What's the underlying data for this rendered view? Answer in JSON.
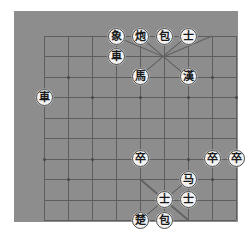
{
  "app": {
    "title": "Xiangqi Board",
    "board_color": "#8d8d8d",
    "line_color": "#5e5e5e",
    "piece_face_color": "#f2f2f2",
    "piece_text_color": "#1a1a1a",
    "page_background": "#ffffff"
  },
  "board": {
    "files": 9,
    "ranks": 10,
    "river_label": "",
    "description": "Chinese chess (Xiangqi) position diagram on a plain gray board"
  },
  "pieces": [
    {
      "id": "p1",
      "label": "象",
      "name": "black-elephant",
      "file": 3,
      "rank": 0,
      "side": "black"
    },
    {
      "id": "p2",
      "label": "炮",
      "name": "black-cannon-1",
      "file": 4,
      "rank": 0,
      "side": "black"
    },
    {
      "id": "p3",
      "label": "包",
      "name": "black-cannon-2",
      "file": 5,
      "rank": 0,
      "side": "black"
    },
    {
      "id": "p4",
      "label": "士",
      "name": "black-advisor-1",
      "file": 6,
      "rank": 0,
      "side": "black"
    },
    {
      "id": "p5",
      "label": "車",
      "name": "black-chariot-1",
      "file": 3,
      "rank": 1,
      "side": "black"
    },
    {
      "id": "p6",
      "label": "馬",
      "name": "black-horse-1",
      "file": 4,
      "rank": 2,
      "side": "black"
    },
    {
      "id": "p7",
      "label": "漢",
      "name": "black-general",
      "file": 6,
      "rank": 2,
      "side": "black"
    },
    {
      "id": "p8",
      "label": "車",
      "name": "black-chariot-2",
      "file": 0,
      "rank": 3,
      "side": "black"
    },
    {
      "id": "p9",
      "label": "卒",
      "name": "red-pawn-1",
      "file": 4,
      "rank": 6,
      "side": "red"
    },
    {
      "id": "p10",
      "label": "卒",
      "name": "red-pawn-2",
      "file": 7,
      "rank": 6,
      "side": "red"
    },
    {
      "id": "p11",
      "label": "卒",
      "name": "red-pawn-3",
      "file": 8,
      "rank": 6,
      "side": "red"
    },
    {
      "id": "p12",
      "label": "马",
      "name": "red-horse",
      "file": 6,
      "rank": 7,
      "side": "red"
    },
    {
      "id": "p13",
      "label": "士",
      "name": "red-advisor-1",
      "file": 5,
      "rank": 8,
      "side": "red"
    },
    {
      "id": "p14",
      "label": "士",
      "name": "red-advisor-2",
      "file": 6,
      "rank": 8,
      "side": "red"
    },
    {
      "id": "p15",
      "label": "楚",
      "name": "red-general",
      "file": 4,
      "rank": 9,
      "side": "red"
    },
    {
      "id": "p16",
      "label": "包",
      "name": "red-cannon",
      "file": 5,
      "rank": 9,
      "side": "red"
    }
  ],
  "markers": [
    {
      "file": 1,
      "rank": 2
    },
    {
      "file": 7,
      "rank": 2
    },
    {
      "file": 0,
      "rank": 3
    },
    {
      "file": 2,
      "rank": 3
    },
    {
      "file": 4,
      "rank": 3
    },
    {
      "file": 6,
      "rank": 3
    },
    {
      "file": 8,
      "rank": 3
    },
    {
      "file": 0,
      "rank": 6
    },
    {
      "file": 2,
      "rank": 6
    },
    {
      "file": 4,
      "rank": 6
    },
    {
      "file": 6,
      "rank": 6
    },
    {
      "file": 8,
      "rank": 6
    },
    {
      "file": 1,
      "rank": 7
    },
    {
      "file": 7,
      "rank": 7
    }
  ]
}
